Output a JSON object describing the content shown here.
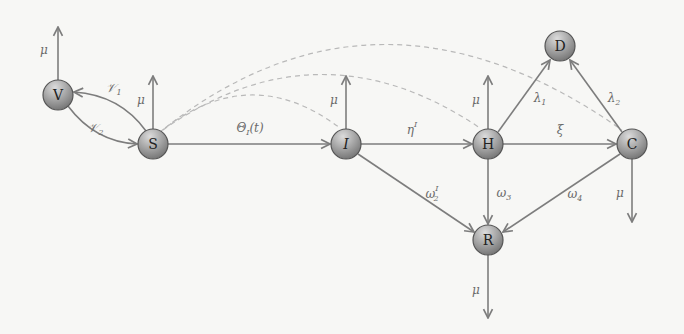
{
  "diagram": {
    "nodes": [
      {
        "id": "V",
        "label": "V",
        "italic": false
      },
      {
        "id": "S",
        "label": "S",
        "italic": false
      },
      {
        "id": "I",
        "label": "I",
        "italic": true
      },
      {
        "id": "H",
        "label": "H",
        "italic": false
      },
      {
        "id": "C",
        "label": "C",
        "italic": false
      },
      {
        "id": "D",
        "label": "D",
        "italic": false
      },
      {
        "id": "R",
        "label": "R",
        "italic": false
      }
    ],
    "edges": [
      {
        "from": "S",
        "to": "V",
        "label": "𝒱",
        "sub": "1",
        "sup": ""
      },
      {
        "from": "V",
        "to": "S",
        "label": "𝒱",
        "sub": "2",
        "sup": ""
      },
      {
        "from": "S",
        "to": "I",
        "label": "Θ",
        "sub": "I",
        "suffix": "(t)"
      },
      {
        "from": "I",
        "to": "H",
        "label": "η",
        "sub": "",
        "sup": "I"
      },
      {
        "from": "H",
        "to": "C",
        "label": "ξ",
        "sub": "",
        "sup": ""
      },
      {
        "from": "H",
        "to": "D",
        "label": "λ",
        "sub": "1",
        "sup": ""
      },
      {
        "from": "C",
        "to": "D",
        "label": "λ",
        "sub": "2",
        "sup": ""
      },
      {
        "from": "I",
        "to": "R",
        "label": "ω",
        "sub": "2",
        "sup": "I"
      },
      {
        "from": "H",
        "to": "R",
        "label": "ω",
        "sub": "3",
        "sup": ""
      },
      {
        "from": "C",
        "to": "R",
        "label": "ω",
        "sub": "4",
        "sup": ""
      }
    ],
    "outflows": [
      {
        "node": "V",
        "label": "μ",
        "direction": "up"
      },
      {
        "node": "S",
        "label": "μ",
        "direction": "up"
      },
      {
        "node": "I",
        "label": "μ",
        "direction": "up"
      },
      {
        "node": "H",
        "label": "μ",
        "direction": "up"
      },
      {
        "node": "C",
        "label": "μ",
        "direction": "down"
      },
      {
        "node": "R",
        "label": "μ",
        "direction": "down"
      }
    ],
    "dashed_links": [
      {
        "from": "S",
        "to": "I"
      },
      {
        "from": "S",
        "to": "H"
      },
      {
        "from": "S",
        "to": "C"
      }
    ],
    "colors": {
      "node_light": "#d0d0d0",
      "node_dark": "#6e6e6e",
      "edge": "#7d7d7d",
      "dashed": "#b9b9b9"
    }
  }
}
